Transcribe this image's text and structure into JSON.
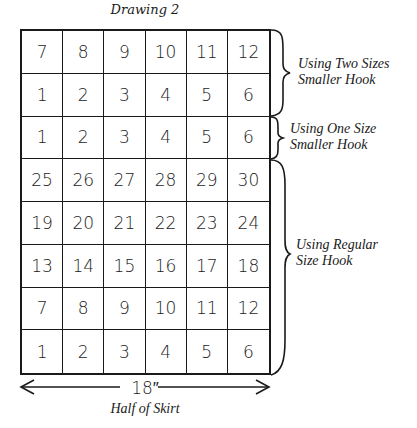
{
  "title": "Drawing 2",
  "grid": {
    "columns": 6,
    "rows": [
      [
        "7",
        "8",
        "9",
        "10",
        "11",
        "12"
      ],
      [
        "1",
        "2",
        "3",
        "4",
        "5",
        "6"
      ],
      [
        "1",
        "2",
        "3",
        "4",
        "5",
        "6"
      ],
      [
        "25",
        "26",
        "27",
        "28",
        "29",
        "30"
      ],
      [
        "19",
        "20",
        "21",
        "22",
        "23",
        "24"
      ],
      [
        "13",
        "14",
        "15",
        "16",
        "17",
        "18"
      ],
      [
        "7",
        "8",
        "9",
        "10",
        "11",
        "12"
      ],
      [
        "1",
        "2",
        "3",
        "4",
        "5",
        "6"
      ]
    ]
  },
  "brackets": [
    {
      "line1": "Using Two Sizes",
      "line2": "Smaller Hook",
      "rows": "1-2"
    },
    {
      "line1": "Using One Size",
      "line2": "Smaller Hook",
      "rows": "3"
    },
    {
      "line1": "Using Regular",
      "line2": "Size Hook",
      "rows": "4-8"
    }
  ],
  "dimension": "18″",
  "caption": "Half of Skirt"
}
